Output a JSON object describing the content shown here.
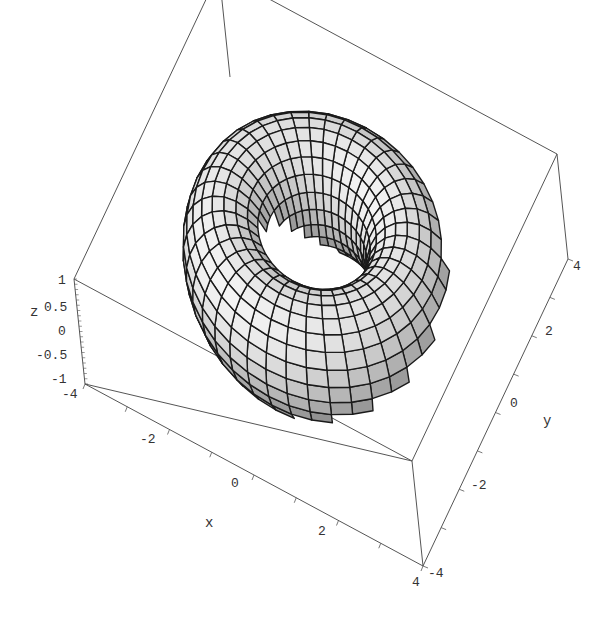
{
  "chart_data": {
    "type": "surface3d",
    "title": "",
    "surface": "torus",
    "parametric": {
      "x": "(2 + cos v) cos u",
      "y": "(2 + cos v) sin u",
      "z": "sin v",
      "major_radius": 2,
      "minor_radius": 1,
      "u_segments": 40,
      "v_segments": 24
    },
    "axes": {
      "x": {
        "label": "x",
        "range": [
          -4,
          4
        ],
        "ticks": [
          -2,
          0,
          2,
          4
        ],
        "tick_labels": [
          "-2",
          "0",
          "2",
          "4"
        ]
      },
      "y": {
        "label": "y",
        "range": [
          -4,
          4
        ],
        "ticks": [
          -4,
          -2,
          0,
          2,
          4
        ],
        "tick_labels": [
          "-4",
          "-2",
          "0",
          "2",
          "4"
        ]
      },
      "z": {
        "label": "z",
        "range": [
          -1,
          1
        ],
        "ticks": [
          1,
          0.5,
          0,
          -0.5,
          -1
        ],
        "tick_labels": [
          "1",
          "0.5",
          "0",
          "-0.5",
          "-1"
        ]
      }
    },
    "x_min_label": "-4",
    "boxed": true,
    "grid": false,
    "legend": null,
    "colors": {
      "mesh": "#1a1a1a",
      "box": "#555555",
      "surface_light": "#f2f2f2",
      "surface_dark": "#7a7a7a"
    }
  }
}
